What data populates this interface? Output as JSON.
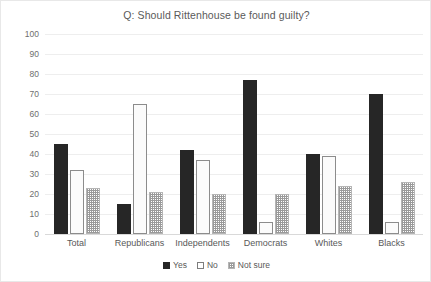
{
  "chart_data": {
    "type": "bar",
    "title": "Q: Should Rittenhouse be found guilty?",
    "xlabel": "",
    "ylabel": "",
    "ylim": [
      0,
      100
    ],
    "yticks": [
      0,
      10,
      20,
      30,
      40,
      50,
      60,
      70,
      80,
      90,
      100
    ],
    "grid": true,
    "legend_position": "bottom",
    "categories": [
      "Total",
      "Republicans",
      "Independents",
      "Democrats",
      "Whites",
      "Blacks"
    ],
    "series": [
      {
        "name": "Yes",
        "values": [
          45,
          15,
          42,
          77,
          40,
          70
        ]
      },
      {
        "name": "No",
        "values": [
          32,
          65,
          37,
          6,
          39,
          6
        ]
      },
      {
        "name": "Not sure",
        "values": [
          23,
          21,
          20,
          20,
          24,
          26
        ]
      }
    ],
    "colors": {
      "Yes": "#262626",
      "No": "#ffffff",
      "Not sure": "#9a9a9a"
    }
  }
}
